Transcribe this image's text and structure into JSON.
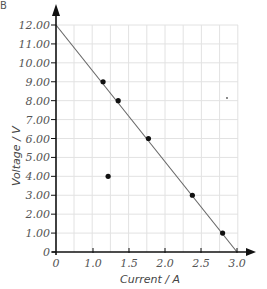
{
  "figure_label": "B",
  "chart_data": {
    "type": "scatter",
    "title": "",
    "xlabel": "Current / A",
    "ylabel": "Voltage / V",
    "x_ticks": [
      "0",
      "1.0",
      "1.5",
      "2.0",
      "2.5",
      "3.0"
    ],
    "y_ticks": [
      "0",
      "1.00",
      "2.00",
      "3.00",
      "4.00",
      "5.00",
      "6.00",
      "7.00",
      "8.00",
      "9.00",
      "10.00",
      "11.00",
      "12.00"
    ],
    "xlim": [
      0,
      3.0
    ],
    "ylim": [
      0,
      12
    ],
    "x_axis_break": "axis scale jumps from 0 directly to 1.0",
    "grid": true,
    "series": [
      {
        "name": "measurements",
        "points": [
          {
            "x": 1.14,
            "y": 9.0
          },
          {
            "x": 1.35,
            "y": 8.0
          },
          {
            "x": 1.77,
            "y": 6.0
          },
          {
            "x": 1.21,
            "y": 4.0
          },
          {
            "x": 2.38,
            "y": 3.0
          },
          {
            "x": 2.8,
            "y": 1.0
          }
        ]
      }
    ],
    "best_fit_line": {
      "from": {
        "x": 0,
        "y": 12.0
      },
      "to": {
        "x": 3.0,
        "y": 0
      }
    },
    "colors": {
      "axis": "#111111",
      "grid": "#e2e2e2",
      "line": "#666666",
      "points": "#111111",
      "text": "#555555"
    }
  }
}
